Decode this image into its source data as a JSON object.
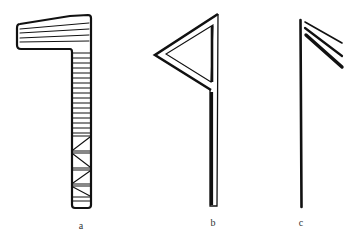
{
  "figure": {
    "ink_color": "#111111",
    "background": "#ffffff",
    "panels": [
      {
        "id": "a",
        "label": "a",
        "description": "L-shaped form with horizontally hatched head and stem; lower stem filled with zig-zag cross pattern",
        "label_pos": {
          "x": 81,
          "y": 221
        }
      },
      {
        "id": "b",
        "label": "b",
        "description": "Vertical double-line staff with double-outlined triangular flag pointing left at top",
        "label_pos": {
          "x": 213,
          "y": 218
        }
      },
      {
        "id": "c",
        "label": "c",
        "description": "Single vertical stroke with three diagonal strokes descending to the right from the top",
        "label_pos": {
          "x": 301,
          "y": 218
        }
      }
    ]
  }
}
